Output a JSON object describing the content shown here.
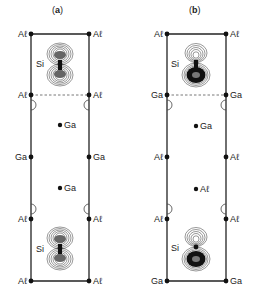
{
  "panels": [
    {
      "id": "a",
      "title_open": "(",
      "title_letter": "a",
      "title_close": ")",
      "corners": {
        "top_left": "Aℓ",
        "top_right": "Aℓ",
        "dash_left": "Aℓ",
        "dash_right": "Aℓ",
        "mid_left": "Ga",
        "mid_right": "Ga",
        "low_left": "Aℓ",
        "low_right": "Aℓ",
        "bottom_left": "Aℓ",
        "bottom_right": "Aℓ"
      },
      "center_upper": "Ga",
      "center_lower": "Ga",
      "si_top": "Si",
      "si_bottom": "Si",
      "orbital_style": "symmetric"
    },
    {
      "id": "b",
      "title_open": "(",
      "title_letter": "b",
      "title_close": ")",
      "corners": {
        "top_left": "Aℓ",
        "top_right": "Aℓ",
        "dash_left": "Ga",
        "dash_right": "Ga",
        "mid_left": "Aℓ",
        "mid_right": "Aℓ",
        "low_left": "Aℓ",
        "low_right": "Aℓ",
        "bottom_left": "Ga",
        "bottom_right": "Ga"
      },
      "center_upper": "Ga",
      "center_lower": "Aℓ",
      "si_top": "Si",
      "si_bottom": "Si",
      "orbital_style": "asymmetric"
    }
  ]
}
